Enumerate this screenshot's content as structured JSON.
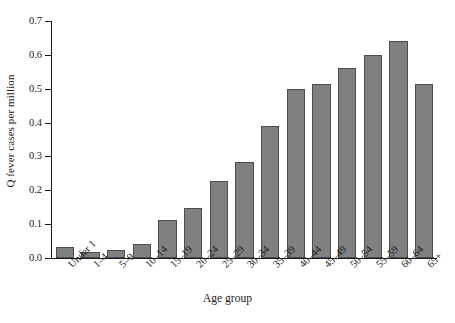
{
  "chart_data": {
    "type": "bar",
    "title": "",
    "xlabel": "Age group",
    "ylabel": "Q fever cases per million",
    "categories": [
      "Under 1",
      "1–4",
      "5–9",
      "10–14",
      "15–19",
      "20–24",
      "25–29",
      "30–34",
      "35–39",
      "40–44",
      "45–49",
      "50–54",
      "55–59",
      "60–64",
      "65+"
    ],
    "values": [
      0.032,
      0.018,
      0.023,
      0.041,
      0.113,
      0.148,
      0.226,
      0.284,
      0.391,
      0.5,
      0.513,
      0.56,
      0.6,
      0.641,
      0.513
    ],
    "ylim": [
      0.0,
      0.7
    ],
    "ytick_labels": [
      "0.0",
      "0.1",
      "0.2",
      "0.3",
      "0.4",
      "0.5",
      "0.6",
      "0.7"
    ],
    "ytick_values": [
      0.0,
      0.1,
      0.2,
      0.3,
      0.4,
      0.5,
      0.6,
      0.7
    ],
    "grid": false,
    "legend": null,
    "bar_color": "#808080",
    "bar_edge_color": "#4d4d4d",
    "axis_color": "#1a1a1a",
    "background_color": "#ffffff"
  }
}
